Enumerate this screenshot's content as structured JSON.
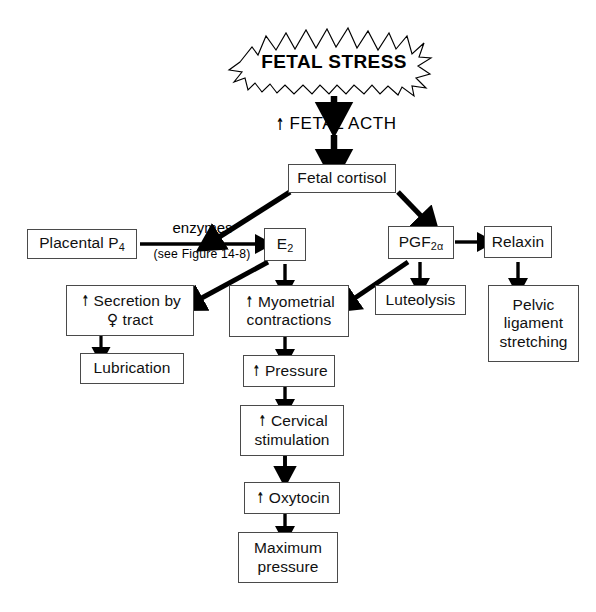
{
  "figure": {
    "type": "flowchart",
    "title_node": "FETAL STRESS"
  },
  "nodes": {
    "fetal_stress": {
      "label": "FETAL STRESS",
      "shape": "starburst"
    },
    "fetal_acth": {
      "label": "FETAL  ACTH",
      "arrow_prefix": "↑",
      "shape": "plain"
    },
    "fetal_cortisol": {
      "label": "Fetal cortisol",
      "shape": "box"
    },
    "placental_p4": {
      "label_main": "Placental P",
      "label_sub": "4",
      "shape": "box"
    },
    "e2": {
      "label_main": "E",
      "label_sub": "2",
      "shape": "box"
    },
    "pgf2a": {
      "label_main": "PGF",
      "label_sub": "2α",
      "shape": "box"
    },
    "relaxin": {
      "label": "Relaxin",
      "shape": "box"
    },
    "luteolysis": {
      "label": "Luteolysis",
      "shape": "box"
    },
    "pelvic_ligament": {
      "line1": "Pelvic",
      "line2": "ligament",
      "line3": "stretching",
      "shape": "box"
    },
    "secretion": {
      "line1": "Secretion by",
      "line2": "tract",
      "arrow_prefix": "↑",
      "venus_symbol": "♀",
      "shape": "box"
    },
    "lubrication": {
      "label": "Lubrication",
      "shape": "box"
    },
    "myometrial": {
      "line1": "Myometrial",
      "line2": "contractions",
      "arrow_prefix": "↑",
      "shape": "box"
    },
    "pressure": {
      "label": "Pressure",
      "arrow_prefix": "↑",
      "shape": "box"
    },
    "cervical": {
      "line1": "Cervical",
      "line2": "stimulation",
      "arrow_prefix": "↑",
      "shape": "box"
    },
    "oxytocin": {
      "label": "Oxytocin",
      "arrow_prefix": "↑",
      "shape": "box"
    },
    "max_pressure": {
      "line1": "Maximum",
      "line2": "pressure",
      "shape": "box"
    }
  },
  "edge_labels": {
    "enzymes": "enzymes",
    "enzymes_note": "(see Figure 14-8)"
  },
  "colors": {
    "stroke": "#000000",
    "box_border": "#4a4a4a",
    "background": "#ffffff",
    "text": "#111111"
  }
}
